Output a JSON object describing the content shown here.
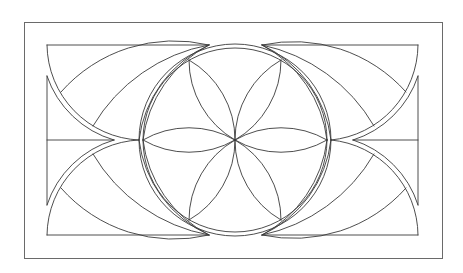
{
  "figure": {
    "title": "Rosette window tracery pattern",
    "stroke_color": "#3a3a3a",
    "frame_color": "#6a6a6a",
    "background": "#ffffff",
    "outer_frame": {
      "x": 24,
      "y": 22,
      "width": 418,
      "height": 236
    },
    "inner_frame": {
      "x": 47,
      "y": 45,
      "width": 371,
      "height": 190
    },
    "central_circle": {
      "cx": 235,
      "cy": 140,
      "outer_r": 96,
      "inner_r": 92,
      "petals": 6
    },
    "convergence_points": [
      {
        "x": 209,
        "y": 45
      },
      {
        "x": 262,
        "y": 45
      },
      {
        "x": 209,
        "y": 235
      },
      {
        "x": 262,
        "y": 235
      }
    ]
  }
}
